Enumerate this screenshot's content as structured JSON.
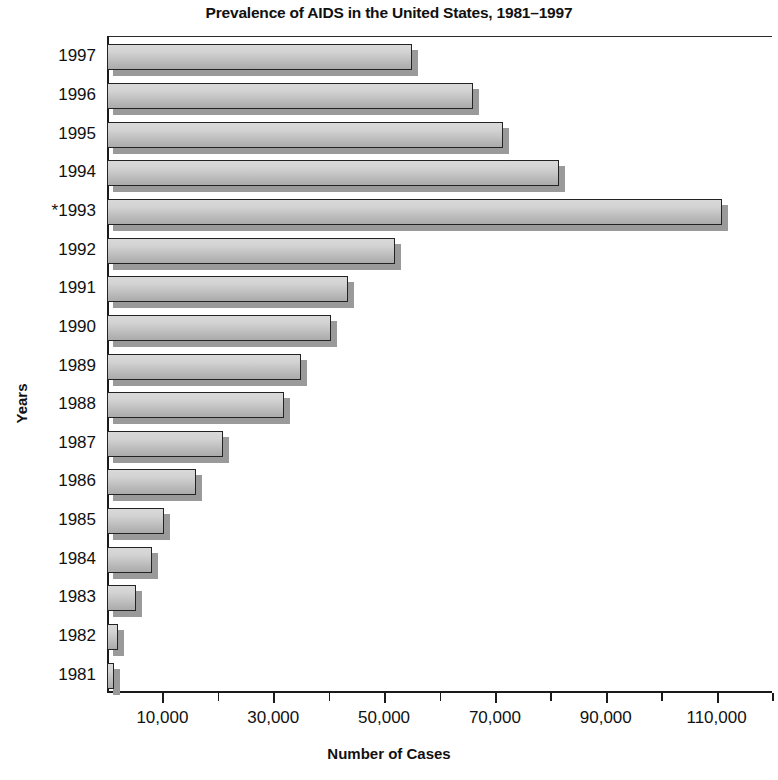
{
  "chart_data": {
    "type": "bar",
    "orientation": "horizontal",
    "title": "Prevalence of AIDS in the United States, 1981–1997",
    "xlabel": "Number of Cases",
    "ylabel": "Years",
    "categories": [
      "1997",
      "1996",
      "1995",
      "1994",
      "*1993",
      "1992",
      "1991",
      "1990",
      "1989",
      "1988",
      "1987",
      "1986",
      "1985",
      "1984",
      "1983",
      "1982",
      "1981"
    ],
    "values": [
      55000,
      66000,
      71500,
      81500,
      111000,
      52000,
      43500,
      40500,
      35000,
      32000,
      21000,
      16000,
      10200,
      8200,
      5300,
      2000,
      1300
    ],
    "xlim": [
      0,
      120000
    ],
    "xticks_major": [
      10000,
      30000,
      50000,
      70000,
      90000,
      110000
    ],
    "xticks_minor": [
      20000,
      40000,
      60000,
      80000,
      100000,
      120000
    ],
    "xtick_labels": [
      "10,000",
      "30,000",
      "50,000",
      "70,000",
      "90,000",
      "110,000"
    ],
    "grid": false,
    "legend": false,
    "bar_fill_light": "#d9d9d9",
    "bar_fill_dark": "#ababab",
    "bar_border": "#232323",
    "bar_shadow": "#9a9a9a",
    "axis_color": "#1a1a1a",
    "background": "#ffffff"
  }
}
